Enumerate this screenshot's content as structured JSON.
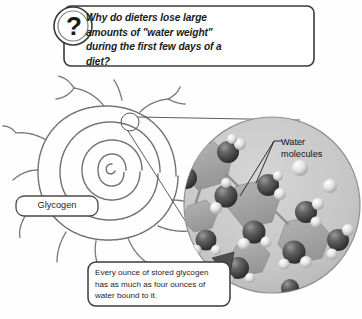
{
  "figure": {
    "type": "illustrated-science-diagram",
    "background_color": "#fefefe"
  },
  "question_callout": {
    "icon": "question-mark-icon",
    "icon_glyph": "?",
    "text": "Why do dieters lose large amounts of \"water weight\" during the first few days of a diet?",
    "box_fill": "#ffffff",
    "box_border": "#3a3a3a"
  },
  "labels": {
    "glycogen": {
      "text": "Glycogen",
      "box_fill": "#ffffff",
      "box_border": "#4a4a4a"
    },
    "water_molecules": {
      "text": "Water molecules",
      "line1": "Water",
      "line2": "molecules",
      "leader_color": "#222222"
    }
  },
  "caption_callout": {
    "text": "Every ounce of stored glycogen has as much as four ounces of water bound to it.",
    "box_fill": "#ffffff",
    "box_border": "#3a3a3a",
    "arrow": "block-arrow-up-right",
    "arrow_color": "#4a4a4a"
  },
  "magnifier": {
    "inset_shape": "circle",
    "inset_fill": "#c9c9c9",
    "inset_border": "#8a8a8a",
    "source_marker": "small-circle-on-spiral"
  },
  "glycogen_structure": {
    "shape": "branched-spiral",
    "stroke_color": "#6f6f6f",
    "texture": "beaded"
  },
  "molecule_legend": {
    "oxygen_color": "#4a4a4a",
    "hydrogen_color": "#e8e8e8",
    "chain_polygon_color": "#a8a8a8"
  }
}
